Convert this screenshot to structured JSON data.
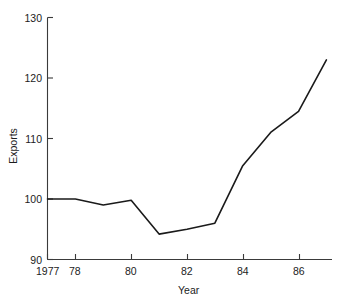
{
  "chart_data": {
    "type": "line",
    "title": "",
    "xlabel": "Year",
    "ylabel": "Exports",
    "x": [
      1977,
      1978,
      1979,
      1980,
      1981,
      1982,
      1983,
      1984,
      1985,
      1986,
      1987
    ],
    "values": [
      100.0,
      100.0,
      99.0,
      99.8,
      94.2,
      95.0,
      96.0,
      105.5,
      111.0,
      114.5,
      123.0
    ],
    "series": [
      {
        "name": "Exports",
        "values": [
          100.0,
          100.0,
          99.0,
          99.8,
          94.2,
          95.0,
          96.0,
          105.5,
          111.0,
          114.5,
          123.0
        ]
      }
    ],
    "xlim": [
      1977,
      1987.2
    ],
    "ylim": [
      90,
      130
    ],
    "ytick_labels": [
      "130",
      "120",
      "110",
      "100",
      "90"
    ],
    "ytick_values": [
      130,
      120,
      110,
      100,
      90
    ],
    "xtick_labels": [
      "1977",
      "78",
      "80",
      "82",
      "84",
      "86"
    ],
    "xtick_values": [
      1977,
      1978,
      1980,
      1982,
      1984,
      1986
    ],
    "grid": false,
    "legend": false,
    "line_color": "#1a1a1a",
    "axis_color": "#3a3a3a"
  },
  "axes": {
    "y_title": "Exports",
    "x_title": "Year",
    "y_ticks": [
      {
        "label": "130"
      },
      {
        "label": "120"
      },
      {
        "label": "110"
      },
      {
        "label": "100"
      },
      {
        "label": "90"
      }
    ],
    "x_ticks": [
      {
        "label": "1977"
      },
      {
        "label": "78"
      },
      {
        "label": "80"
      },
      {
        "label": "82"
      },
      {
        "label": "84"
      },
      {
        "label": "86"
      }
    ]
  }
}
